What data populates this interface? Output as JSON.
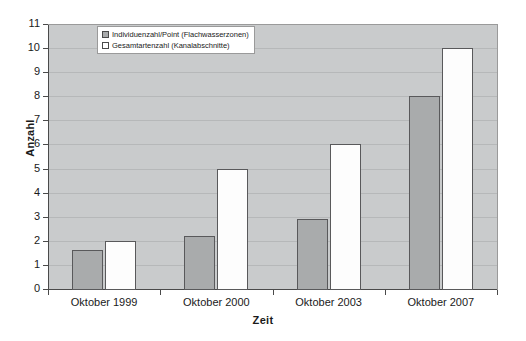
{
  "chart_data": {
    "type": "bar",
    "title": "",
    "xlabel": "Zeit",
    "ylabel": "Anzahl",
    "ylim": [
      0,
      11
    ],
    "grid": true,
    "legend_position": "top-left-inside",
    "categories": [
      "Oktober 1999",
      "Oktober 2000",
      "Oktober 2003",
      "Oktober 2007"
    ],
    "yticks": [
      "0",
      "1",
      "2",
      "3",
      "4",
      "5",
      "6",
      "7",
      "8",
      "9",
      "10",
      "11"
    ],
    "series": [
      {
        "name": "Individuenzahl/Point (Flachwasserzonen)",
        "color": "#a9abac",
        "values": [
          1.6,
          2.2,
          2.9,
          8.0
        ]
      },
      {
        "name": "Gesamtartenzahl (Kanalabschnitte)",
        "color": "#ffffff",
        "values": [
          2.0,
          5.0,
          6.0,
          10.0
        ]
      }
    ]
  },
  "legend": {
    "items": [
      {
        "label": "Individuenzahl/Point (Flachwasserzonen)",
        "swatch": "legend-swatch-filled-gray"
      },
      {
        "label": "Gesamtartenzahl (Kanalabschnitte)",
        "swatch": "legend-swatch-white"
      }
    ]
  }
}
